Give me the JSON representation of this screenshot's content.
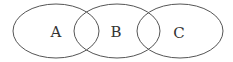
{
  "diagram": {
    "type": "venn",
    "sets": [
      {
        "label": "A",
        "cx": 56,
        "cy": 31,
        "rx": 43,
        "ry": 27
      },
      {
        "label": "B",
        "cx": 117,
        "cy": 31,
        "rx": 43,
        "ry": 27
      },
      {
        "label": "C",
        "cx": 180,
        "cy": 31,
        "rx": 43,
        "ry": 27
      }
    ],
    "stroke_color": "#555555",
    "background": "#ffffff"
  }
}
